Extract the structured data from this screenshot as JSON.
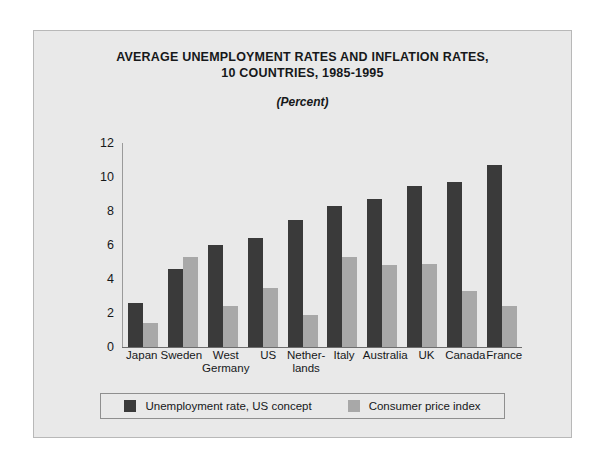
{
  "chart_data": {
    "type": "bar",
    "title": "AVERAGE UNEMPLOYMENT RATES AND INFLATION RATES, 10 COUNTRIES, 1985-1995",
    "title_lines": [
      "AVERAGE UNEMPLOYMENT RATES AND INFLATION RATES,",
      "10 COUNTRIES, 1985-1995"
    ],
    "subtitle": "(Percent)",
    "xlabel": "",
    "ylabel": "",
    "ylim": [
      0,
      12
    ],
    "yticks": [
      12,
      10,
      8,
      6,
      4,
      2,
      0
    ],
    "grid": false,
    "legend_position": "bottom",
    "categories": [
      "Japan",
      "Sweden",
      "West Germany",
      "US",
      "Netherlands",
      "Italy",
      "Australia",
      "UK",
      "Canada",
      "France"
    ],
    "category_lines": [
      [
        "Japan"
      ],
      [
        "Sweden"
      ],
      [
        "West",
        "Germany"
      ],
      [
        "US"
      ],
      [
        "Nether-",
        "lands"
      ],
      [
        "Italy"
      ],
      [
        "Australia"
      ],
      [
        "UK"
      ],
      [
        "Canada"
      ],
      [
        "France"
      ]
    ],
    "series": [
      {
        "name": "Unemployment rate, US concept",
        "color": "#3a3a3a",
        "values": [
          2.6,
          4.6,
          6.0,
          6.4,
          7.5,
          8.3,
          8.7,
          9.5,
          9.7,
          10.7
        ]
      },
      {
        "name": "Consumer price index",
        "color": "#a8a8a8",
        "values": [
          1.4,
          5.3,
          2.4,
          3.5,
          1.9,
          5.3,
          4.8,
          4.9,
          3.3,
          2.4
        ]
      }
    ]
  },
  "legend": {
    "items": [
      {
        "label": "Unemployment rate, US concept",
        "swatch": "dark"
      },
      {
        "label": "Consumer price index",
        "swatch": "light"
      }
    ]
  },
  "colors": {
    "page_background": "#ffffff",
    "panel_background": "#e9e9e9",
    "panel_border": "#b8b8b8",
    "series_dark": "#3a3a3a",
    "series_light": "#a8a8a8",
    "axis": "#6d6d6d",
    "text": "#16181a"
  }
}
